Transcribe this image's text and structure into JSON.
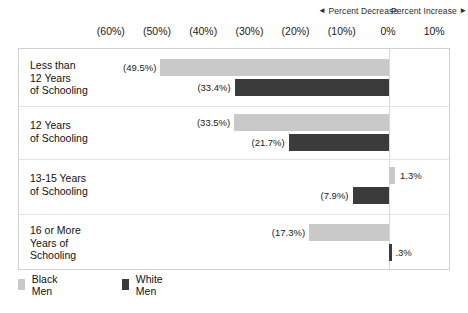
{
  "header": {
    "decrease_label": "Percent Decrease",
    "increase_label": "Percent Increase",
    "decrease_arrow": "◄",
    "increase_arrow": "►"
  },
  "legend": {
    "items": [
      {
        "label": "Black Men",
        "color": "#c9c9c9",
        "key": "black-men"
      },
      {
        "label": "White Men",
        "color": "#3b3b3b",
        "key": "white-men"
      }
    ]
  },
  "axis": {
    "ticks": [
      {
        "label": "(60%)",
        "value": -60
      },
      {
        "label": "(50%)",
        "value": -50
      },
      {
        "label": "(40%)",
        "value": -40
      },
      {
        "label": "(30%)",
        "value": -30
      },
      {
        "label": "(20%)",
        "value": -20
      },
      {
        "label": "(10%)",
        "value": -10
      },
      {
        "label": "0%",
        "value": 0
      },
      {
        "label": "10%",
        "value": 10
      }
    ]
  },
  "rows": [
    {
      "category": "Less than\n12 Years\nof Schooling",
      "black": {
        "label": "(49.5%)",
        "value": -49.5
      },
      "white": {
        "label": "(33.4%)",
        "value": -33.4
      }
    },
    {
      "category": "12 Years\nof Schooling",
      "black": {
        "label": "(33.5%)",
        "value": -33.5
      },
      "white": {
        "label": "(21.7%)",
        "value": -21.7
      }
    },
    {
      "category": "13-15 Years\nof Schooling",
      "black": {
        "label": "1.3%",
        "value": 1.3
      },
      "white": {
        "label": "(7.9%)",
        "value": -7.9
      }
    },
    {
      "category": "16 or More\nYears of\nSchooling",
      "black": {
        "label": "(17.3%)",
        "value": -17.3
      },
      "white": {
        "label": ".3%",
        "value": 0.3
      }
    }
  ],
  "chart_data": {
    "type": "bar",
    "orientation": "horizontal",
    "title": "",
    "subtitle": "",
    "xlabel": "",
    "ylabel": "",
    "xlim": [
      -65,
      15
    ],
    "grid": false,
    "legend_position": "bottom-left",
    "annotations": [
      "◄ Percent Decrease",
      "Percent Increase ►"
    ],
    "xtick_labels": [
      "(60%)",
      "(50%)",
      "(40%)",
      "(30%)",
      "(20%)",
      "(10%)",
      "0%",
      "10%"
    ],
    "xtick_values": [
      -60,
      -50,
      -40,
      -30,
      -20,
      -10,
      0,
      10
    ],
    "categories": [
      "Less than 12 Years of Schooling",
      "12 Years of Schooling",
      "13-15 Years of Schooling",
      "16 or More Years of Schooling"
    ],
    "series": [
      {
        "name": "Black Men",
        "color": "#c9c9c9",
        "values": [
          -49.5,
          -33.5,
          1.3,
          -17.3
        ],
        "data_labels": [
          "(49.5%)",
          "(33.5%)",
          "1.3%",
          "(17.3%)"
        ]
      },
      {
        "name": "White Men",
        "color": "#3b3b3b",
        "values": [
          -33.4,
          -21.7,
          -7.9,
          0.3
        ],
        "data_labels": [
          "(33.4%)",
          "(21.7%)",
          "(7.9%)",
          ".3%"
        ]
      }
    ]
  }
}
